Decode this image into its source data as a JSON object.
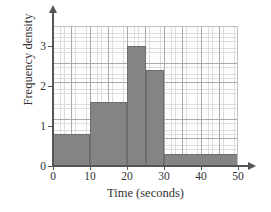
{
  "chart_data": {
    "type": "bar",
    "title": "",
    "xlabel": "Time (seconds)",
    "ylabel": "Frequency density",
    "xlim": [
      0,
      50
    ],
    "ylim": [
      0,
      3.5
    ],
    "xticks": [
      "0",
      "10",
      "20",
      "30",
      "40",
      "50"
    ],
    "xtick_values": [
      0,
      10,
      20,
      30,
      40,
      50
    ],
    "yticks": [
      "0",
      "1",
      "2",
      "3"
    ],
    "ytick_values": [
      0,
      1,
      2,
      3
    ],
    "grid": true,
    "legend": "none",
    "bins": [
      {
        "label": "0-10",
        "start": 0,
        "end": 10,
        "value": 0.8
      },
      {
        "label": "10-20",
        "start": 10,
        "end": 20,
        "value": 1.6
      },
      {
        "label": "20-25",
        "start": 20,
        "end": 25,
        "value": 3.0
      },
      {
        "label": "25-30",
        "start": 25,
        "end": 30,
        "value": 2.4
      },
      {
        "label": "30-50",
        "start": 30,
        "end": 50,
        "value": 0.3
      }
    ],
    "bar_color": "#848484",
    "grid_color": "#d8d8d8",
    "axis_color": "#555555"
  }
}
